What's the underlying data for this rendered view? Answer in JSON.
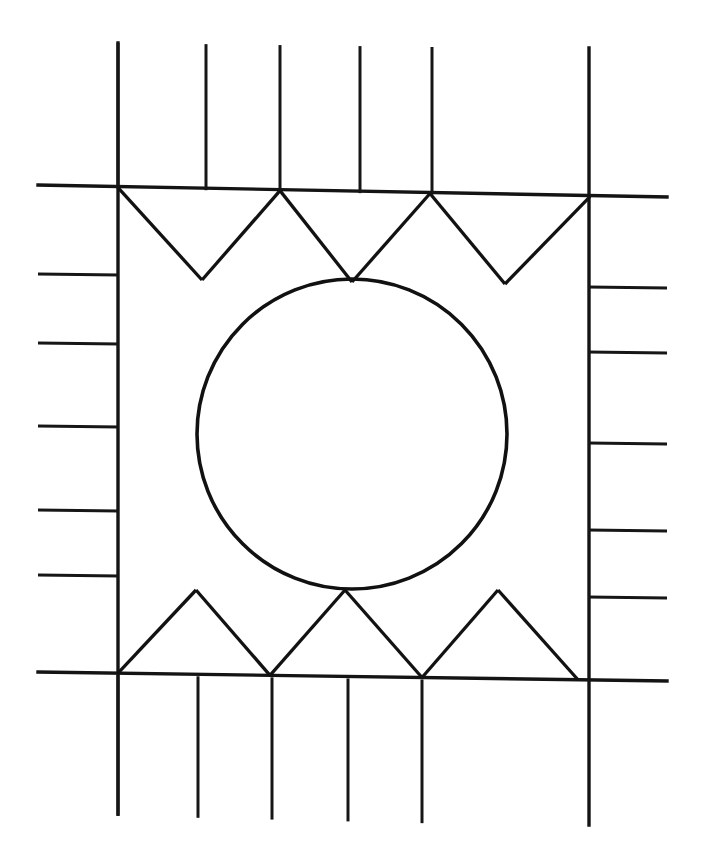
{
  "document": {
    "kind": "line-art-geometric-diagram",
    "title": "Quilt Block Pattern Diagram",
    "description": "Black line drawing of a rectangular quilt block: an outer border of rectangular patches, an inner band of triangles at top and bottom, flanking side bars, and a large circle inscribed in the central square.",
    "background_color": "#ffffff",
    "line_color": "#111111",
    "width": 701,
    "height": 865
  },
  "canvas": {
    "width": 701,
    "height": 865
  },
  "geometry": {
    "outer_frame": {
      "name": "outer-rectangle",
      "top_left": [
        38,
        42
      ],
      "top_right": [
        667,
        50
      ],
      "bottom_right": [
        667,
        827
      ],
      "bottom_left": [
        38,
        812
      ]
    },
    "band_lines": {
      "top_band_bottom_left": [
        38,
        185
      ],
      "top_band_bottom_right": [
        667,
        197
      ],
      "bottom_band_top_left": [
        38,
        672
      ],
      "bottom_band_top_right": [
        667,
        681
      ]
    },
    "side_dividers": {
      "left_vertical_x": 118,
      "right_vertical_x": 589
    },
    "inner_square": {
      "name": "center-square",
      "left": 202,
      "right": 505,
      "top": 279,
      "bottom": 590
    },
    "circle": {
      "name": "inscribed-circle",
      "center_x": 352,
      "center_y": 434,
      "radius": 155
    },
    "top_band_columns_x": [
      38,
      118,
      206,
      280,
      360,
      432,
      512,
      592,
      667
    ],
    "bottom_band_columns_x": [
      38,
      118,
      198,
      272,
      348,
      422,
      500,
      578,
      667
    ],
    "left_band_rows_y": [
      185,
      274,
      343,
      426,
      510,
      575,
      672
    ],
    "right_band_rows_y": [
      197,
      287,
      352,
      443,
      530,
      597,
      681
    ],
    "top_triangles": {
      "apex_on_top_line_x": [
        118,
        280,
        430,
        590
      ],
      "apex_on_bottom_line_x": [
        202,
        352,
        505
      ]
    },
    "bottom_triangles": {
      "apex_on_top_line_x": [
        196,
        345,
        498
      ],
      "apex_on_bottom_line_x": [
        118,
        270,
        422,
        578
      ]
    }
  },
  "counts": {
    "top_border_patches": 8,
    "bottom_border_patches": 8,
    "left_border_patches": 6,
    "right_border_patches": 6,
    "top_triangles": 6,
    "bottom_triangles": 6,
    "circles": 1
  },
  "labels": {
    "none": ""
  }
}
